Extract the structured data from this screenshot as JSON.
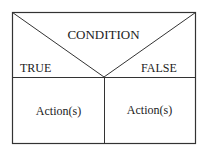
{
  "diagram": {
    "type": "nassi-shneiderman-decision",
    "condition_label": "CONDITION",
    "true_label": "TRUE",
    "false_label": "FALSE",
    "true_action": "Action(s)",
    "false_action": "Action(s)",
    "line_color": "#333333"
  }
}
